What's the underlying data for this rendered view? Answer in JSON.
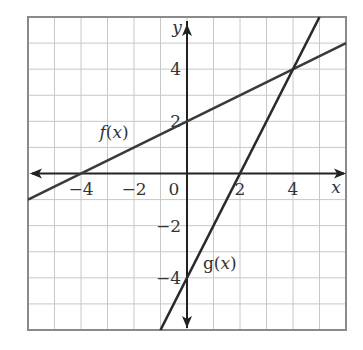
{
  "chart_data": {
    "type": "line",
    "title": "",
    "xlabel": "x",
    "ylabel": "y",
    "xlim": [
      -6,
      6
    ],
    "ylim": [
      -6,
      6
    ],
    "grid": true,
    "grid_step": 1,
    "x_ticks": [
      {
        "value": -4,
        "label": "−4"
      },
      {
        "value": -2,
        "label": "−2"
      },
      {
        "value": 0,
        "label": "0"
      },
      {
        "value": 2,
        "label": "2"
      },
      {
        "value": 4,
        "label": "4"
      }
    ],
    "y_ticks": [
      {
        "value": 4,
        "label": "4"
      },
      {
        "value": 2,
        "label": "2"
      },
      {
        "value": -2,
        "label": "−2"
      },
      {
        "value": -4,
        "label": "−4"
      }
    ],
    "series": [
      {
        "name": "f(x)",
        "label_func": "f",
        "equation": "f(x) = 0.5x + 2",
        "slope": 0.5,
        "intercept": 2,
        "x": [
          -6,
          -4,
          0,
          4,
          6
        ],
        "y": [
          -1,
          0,
          2,
          4,
          5
        ],
        "label_pos": {
          "x": -3.3,
          "y": 1.35
        },
        "color": "#3a3a3a"
      },
      {
        "name": "g(x)",
        "label_func": "g",
        "equation": "g(x) = 2x - 4",
        "slope": 2,
        "intercept": -4,
        "x": [
          -1,
          0,
          2,
          4,
          5
        ],
        "y": [
          -6,
          -4,
          0,
          4,
          6
        ],
        "label_pos": {
          "x": 0.6,
          "y": -3.65
        },
        "color": "#2a2a2a"
      }
    ],
    "annotations": [
      {
        "type": "intersection",
        "x": 4,
        "y": 4
      }
    ]
  },
  "colors": {
    "grid": "#c8c8c8",
    "frame": "#8a8a8a",
    "axis": "#222222",
    "text": "#333333"
  }
}
